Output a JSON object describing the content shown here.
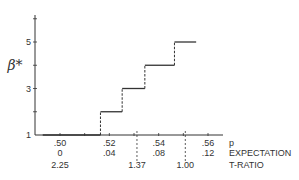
{
  "chart_data": {
    "type": "line",
    "subtype": "step",
    "title": "",
    "ylabel": "β*",
    "xlabel_rows": [
      "p",
      "EXPECTATION",
      "T-RATIO"
    ],
    "ylim": [
      1,
      6
    ],
    "xlim": [
      0.493,
      0.5612
    ],
    "y_ticks": [
      {
        "value": 1,
        "label": "1"
      },
      {
        "value": 2,
        "label": ""
      },
      {
        "value": 3,
        "label": "3"
      },
      {
        "value": 4,
        "label": ""
      },
      {
        "value": 5,
        "label": "5"
      },
      {
        "value": 6,
        "label": ""
      }
    ],
    "x_ticks": [
      {
        "p": 0.5,
        "p_label": ".50",
        "expectation_label": "0"
      },
      {
        "p": 0.51,
        "p_label": "",
        "expectation_label": ""
      },
      {
        "p": 0.52,
        "p_label": ".52",
        "expectation_label": ".04"
      },
      {
        "p": 0.53,
        "p_label": "",
        "expectation_label": ""
      },
      {
        "p": 0.54,
        "p_label": ".54",
        "expectation_label": ".08"
      },
      {
        "p": 0.55,
        "p_label": "",
        "expectation_label": ""
      },
      {
        "p": 0.56,
        "p_label": ".56",
        "expectation_label": ".12"
      }
    ],
    "t_ratio_marks": [
      {
        "p": 0.5,
        "label": "2.25",
        "dashed": false
      },
      {
        "p": 0.5312,
        "label": "1.37",
        "dashed": true
      },
      {
        "p": 0.5508,
        "label": "1.00",
        "dashed": true
      }
    ],
    "series": [
      {
        "name": "beta-star step function",
        "steps": [
          {
            "p_start": 0.493,
            "p_end": 0.5164,
            "value": 1
          },
          {
            "p_start": 0.5164,
            "p_end": 0.5252,
            "value": 2
          },
          {
            "p_start": 0.5252,
            "p_end": 0.5344,
            "value": 3
          },
          {
            "p_start": 0.5344,
            "p_end": 0.5464,
            "value": 4
          },
          {
            "p_start": 0.5464,
            "p_end": 0.5552,
            "value": 5
          }
        ]
      }
    ],
    "grid": false,
    "legend": null
  }
}
